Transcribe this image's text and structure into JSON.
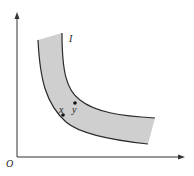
{
  "diagram": {
    "type": "indifference-band",
    "origin_label": "O",
    "band_label": "I",
    "points": [
      {
        "label": "x",
        "cx": 63,
        "cy": 115
      },
      {
        "label": "y",
        "cx": 75,
        "cy": 103
      }
    ],
    "colors": {
      "axis": "#333333",
      "band_fill": "#cfcfcf",
      "band_edge": "#2a2a2a",
      "point": "#111111"
    }
  }
}
